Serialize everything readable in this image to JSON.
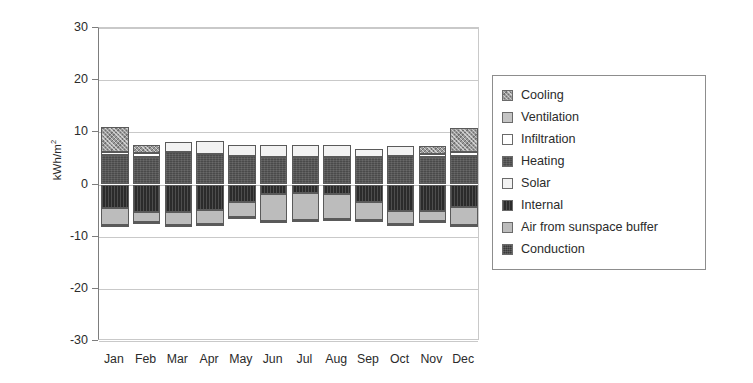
{
  "chart_data": {
    "type": "bar",
    "stacked": true,
    "title": "",
    "subtitle": "",
    "xlabel": "",
    "ylabel": "kWh/m²",
    "ylabel_base": "kWh/m",
    "ylabel_sup": "2",
    "ylim": [
      -30,
      30
    ],
    "yticks": [
      30,
      20,
      10,
      0,
      -10,
      -20,
      -30
    ],
    "ytick_labels": [
      "30",
      "20",
      "10",
      "0",
      "-10",
      "-20",
      "-30"
    ],
    "grid": true,
    "grid_axis": "y",
    "legend_position": "right-outside",
    "categories": [
      "Jan",
      "Feb",
      "Mar",
      "Apr",
      "May",
      "Jun",
      "Jul",
      "Aug",
      "Sep",
      "Oct",
      "Nov",
      "Dec"
    ],
    "series": [
      {
        "name": "Cooling",
        "color": "#9a9a9a",
        "pattern": "cross-hatch",
        "values": [
          4.9,
          1.6,
          0.0,
          0.0,
          0.0,
          0.0,
          0.0,
          0.0,
          0.0,
          0.0,
          1.5,
          4.6
        ]
      },
      {
        "name": "Ventilation",
        "color": "#c4c4c4",
        "pattern": "solid",
        "values": [
          0.0,
          0.0,
          0.0,
          0.0,
          0.0,
          0.0,
          0.0,
          0.0,
          0.0,
          0.0,
          0.0,
          0.0
        ]
      },
      {
        "name": "Infiltration",
        "color": "#ffffff",
        "pattern": "solid",
        "values": [
          0.6,
          0.7,
          0.0,
          0.0,
          0.0,
          0.0,
          0.0,
          0.0,
          0.0,
          0.0,
          0.6,
          0.7
        ]
      },
      {
        "name": "Heating",
        "color": "#4a4a4a",
        "pattern": "fine-weave",
        "values": [
          5.6,
          5.3,
          6.3,
          5.8,
          5.4,
          5.2,
          5.2,
          5.3,
          5.2,
          5.4,
          5.3,
          5.5
        ]
      },
      {
        "name": "Solar",
        "color": "#f2f2f2",
        "pattern": "solid",
        "values": [
          0.0,
          0.0,
          1.9,
          2.5,
          2.1,
          2.3,
          2.3,
          2.2,
          1.7,
          1.9,
          0.0,
          0.0
        ]
      },
      {
        "name": "Internal",
        "color": "#2b2b2b",
        "pattern": "vertical-line",
        "values": [
          -4.5,
          -5.3,
          -5.2,
          -4.9,
          -3.3,
          -1.9,
          -1.7,
          -1.8,
          -3.4,
          -5.0,
          -5.1,
          -4.4
        ]
      },
      {
        "name": "Air from sunspace buffer",
        "color": "#bcbcbc",
        "pattern": "solid",
        "values": [
          -3.3,
          -1.8,
          -2.5,
          -2.6,
          -3.0,
          -5.1,
          -5.2,
          -4.9,
          -3.4,
          -2.6,
          -1.9,
          -3.4
        ]
      },
      {
        "name": "Conduction",
        "color": "#3a3a3a",
        "pattern": "dense-weave",
        "values": [
          -0.4,
          -0.4,
          -0.3,
          -0.3,
          -0.3,
          -0.3,
          -0.3,
          -0.3,
          -0.3,
          -0.3,
          -0.4,
          -0.4
        ]
      }
    ],
    "positive_totals": [
      11.1,
      7.6,
      8.2,
      8.3,
      7.5,
      7.5,
      7.5,
      7.5,
      6.9,
      7.3,
      7.4,
      10.8
    ],
    "negative_totals": [
      -8.2,
      -7.5,
      -8.0,
      -7.8,
      -6.6,
      -7.3,
      -7.2,
      -7.0,
      -7.1,
      -7.9,
      -7.4,
      -8.2
    ]
  },
  "legend": {
    "items": [
      {
        "label": "Cooling"
      },
      {
        "label": "Ventilation"
      },
      {
        "label": "Infiltration"
      },
      {
        "label": "Heating"
      },
      {
        "label": "Solar"
      },
      {
        "label": "Internal"
      },
      {
        "label": "Air from sunspace buffer"
      },
      {
        "label": "Conduction"
      }
    ]
  }
}
